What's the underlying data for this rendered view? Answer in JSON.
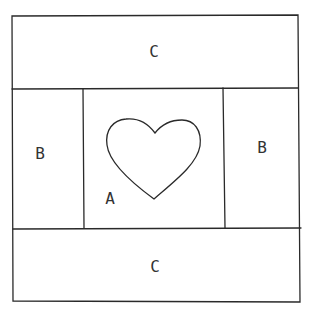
{
  "diagram": {
    "stroke_color": "#2a2a2a",
    "background": "#ffffff",
    "panels": [
      {
        "id": "top",
        "label": "C"
      },
      {
        "id": "left",
        "label": "B"
      },
      {
        "id": "center",
        "label": "A"
      },
      {
        "id": "right",
        "label": "B"
      },
      {
        "id": "bottom",
        "label": "C"
      }
    ],
    "motif": "heart"
  }
}
